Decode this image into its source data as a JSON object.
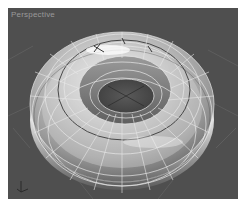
{
  "viewport": {
    "label": "Perspective",
    "background": "#4f4f4f",
    "grid_color": "#6e6e6e"
  },
  "object": {
    "type": "torus",
    "shading": "smooth + edged faces",
    "surface_color": "#bdbdbd",
    "highlight_color": "#ffffff",
    "wire_color": "#e8e8e8",
    "selection_ring_color": "#3a3a3a"
  },
  "gizmo": {
    "axes": [
      "X",
      "Y",
      "Z"
    ]
  }
}
